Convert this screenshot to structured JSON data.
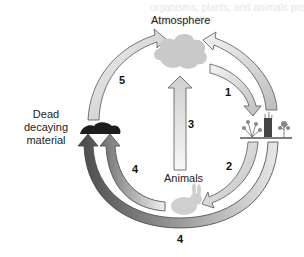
{
  "diagram": {
    "nodes": {
      "atmosphere": "Atmosphere",
      "animals": "Animals",
      "dead_material_line1": "Dead",
      "dead_material_line2": "decaying",
      "dead_material_line3": "material"
    },
    "arrows": {
      "a1": "1",
      "a2": "2",
      "a3": "3",
      "a4_inner": "4",
      "a4_outer": "4",
      "a5": "5"
    },
    "bleed_text": {
      "line1": "organisms, plants, and animals produce",
      "line2": "organic matter"
    }
  }
}
